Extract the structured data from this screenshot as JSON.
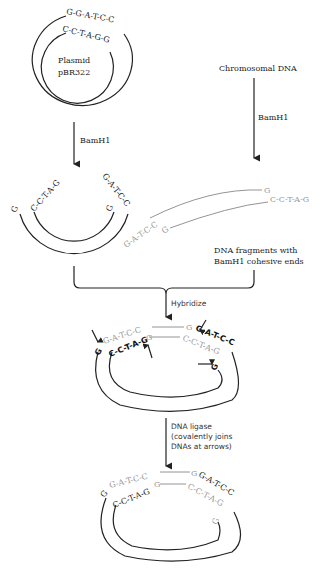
{
  "plasmid": {
    "label_line1": "Plasmid",
    "label_line2": "pBR322",
    "outer_seq": "G-G-A-T-C-C",
    "inner_seq": "C-C-T-A-G-G"
  },
  "chromosomal": {
    "label": "Chromosomal DNA"
  },
  "enzyme": {
    "left": "BamH1",
    "right": "BamH1"
  },
  "cut_plasmid": {
    "left_outer": "G",
    "left_inner": "C-C-T-A-G",
    "right_outer": "G-A-T-C-C",
    "right_inner": "G"
  },
  "fragment": {
    "left_seq": "G-A-T-C-C",
    "left_end": "G",
    "right_top": "G",
    "right_bottom": "C-C-T-A-G",
    "caption_line1": "DNA fragments with",
    "caption_line2": "BamH1 cohesive ends"
  },
  "hybridize": {
    "label": "Hybridize",
    "outer_left": "G",
    "frag_top": "G-A-T-C-C",
    "frag_top_end": "G",
    "outer_right": "G-A-T-C-C",
    "inner_left": "C-C-T-A-G",
    "frag_bottom_start": "G",
    "frag_bottom": "C-C-T-A-G",
    "inner_right": "G"
  },
  "ligase": {
    "line1": "DNA ligase",
    "line2": "(covalently joins",
    "line3": "DNAs at arrows)"
  },
  "final": {
    "outer_left": "G",
    "frag_top": "G-A-T-C-C",
    "frag_top_end": "G",
    "outer_right": "G-A-T-C-C",
    "inner_left": "C-C-T-A-G",
    "frag_bottom_start": "G",
    "frag_bottom": "C-C-T-A-G",
    "inner_right": "G"
  }
}
